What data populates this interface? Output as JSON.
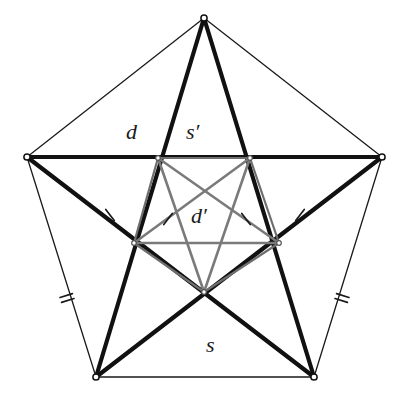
{
  "figure": {
    "background_color": "#ffffff",
    "colors": {
      "outer_pentagon_edge": "#1a1a1a",
      "diagonal_thick": "#111111",
      "inner_pentagon_edge": "#6e6e6e",
      "inner_diagonal": "#7a7a7a",
      "vertex_dot_fill": "#ffffff",
      "vertex_dot_stroke": "#111111",
      "tick_mark": "#1a1a1a",
      "label_text": "#1a1a1a"
    },
    "stroke_widths": {
      "outer_pentagon_edge": 1.3,
      "diagonal_thick": 4.2,
      "inner_pentagon_edge": 2.2,
      "inner_diagonal": 2.6,
      "tick_mark": 1.6
    },
    "outer_vertices": [
      {
        "name": "top",
        "x": 204,
        "y": 18
      },
      {
        "name": "right",
        "x": 382,
        "y": 157
      },
      {
        "name": "bottom-right",
        "x": 314,
        "y": 377
      },
      {
        "name": "bottom-left",
        "x": 96,
        "y": 377
      },
      {
        "name": "left",
        "x": 27,
        "y": 157
      }
    ],
    "inner_vertices": [
      {
        "name": "inner-top-left",
        "x": 158,
        "y": 158
      },
      {
        "name": "inner-top-right",
        "x": 250,
        "y": 158
      },
      {
        "name": "inner-right",
        "x": 279,
        "y": 243
      },
      {
        "name": "inner-bottom",
        "x": 204,
        "y": 292
      },
      {
        "name": "inner-left",
        "x": 134,
        "y": 243
      }
    ],
    "labels": [
      {
        "id": "d",
        "text": "d",
        "x": 133,
        "y": 132,
        "meaning": "diagonal of outer pentagon"
      },
      {
        "id": "sprime",
        "text": "s′",
        "x": 193,
        "y": 132,
        "meaning": "side of inner pentagon"
      },
      {
        "id": "dprime",
        "text": "d′",
        "x": 198,
        "y": 216,
        "meaning": "diagonal of inner pentagon"
      },
      {
        "id": "s",
        "text": "s",
        "x": 210,
        "y": 345,
        "meaning": "side of outer pentagon"
      }
    ],
    "tick_marks": [
      {
        "id": "single-left-outer",
        "count": 1,
        "x": 110,
        "y": 215,
        "angle": -38,
        "segment": "left vertex to inner-left"
      },
      {
        "id": "single-left-inner",
        "count": 1,
        "x": 167,
        "y": 219,
        "angle": 38,
        "segment": "inner-left to inner-top-right"
      },
      {
        "id": "single-right-inner",
        "count": 1,
        "x": 247,
        "y": 219,
        "angle": -38,
        "segment": "inner-right to inner-top-left"
      },
      {
        "id": "single-right-outer",
        "count": 1,
        "x": 300,
        "y": 215,
        "angle": 38,
        "segment": "right vertex to inner-right"
      },
      {
        "id": "double-left",
        "count": 2,
        "x": 66,
        "y": 298,
        "angle": 72,
        "segment": "left to bottom-left pentagon edge"
      },
      {
        "id": "double-right",
        "count": 2,
        "x": 343,
        "y": 298,
        "angle": -72,
        "segment": "right to bottom-right pentagon edge"
      }
    ]
  }
}
